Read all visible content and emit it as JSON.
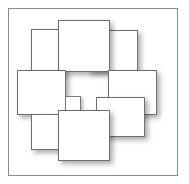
{
  "figure": {
    "title": "",
    "canvas": {
      "width": 189,
      "height": 184,
      "background": "#ffffff"
    },
    "frame": {
      "name": "outer-frame",
      "x": 8,
      "y": 8,
      "width": 170,
      "height": 168,
      "stroke": "#8c8c8c",
      "fill": "#ffffff"
    },
    "shadow": {
      "offset_x": 3,
      "offset_y": 3,
      "blur": 5,
      "color": "rgba(0,0,0,0.32)"
    },
    "tiles": [
      {
        "id": "tile-top-left",
        "label": "",
        "x": 31,
        "y": 29,
        "width": 32,
        "height": 46,
        "z": 2,
        "stroke": "#6e6e6e",
        "fill": "#ffffff"
      },
      {
        "id": "tile-top-center",
        "label": "",
        "x": 58,
        "y": 20,
        "width": 52,
        "height": 52,
        "z": 4,
        "stroke": "#6e6e6e",
        "fill": "#ffffff"
      },
      {
        "id": "tile-top-right",
        "label": "",
        "x": 88,
        "y": 30,
        "width": 50,
        "height": 42,
        "z": 3,
        "stroke": "#6e6e6e",
        "fill": "#ffffff"
      },
      {
        "id": "tile-middle-left",
        "label": "",
        "x": 17,
        "y": 70,
        "width": 49,
        "height": 45,
        "z": 5,
        "stroke": "#6e6e6e",
        "fill": "#ffffff"
      },
      {
        "id": "tile-center",
        "label": "",
        "x": 65,
        "y": 96,
        "width": 16,
        "height": 17,
        "z": 6,
        "stroke": "#7a7a7a",
        "fill": "#ffffff"
      },
      {
        "id": "tile-middle-right",
        "label": "",
        "x": 108,
        "y": 70,
        "width": 49,
        "height": 45,
        "z": 5,
        "stroke": "#6e6e6e",
        "fill": "#ffffff"
      },
      {
        "id": "tile-bottom-left",
        "label": "",
        "x": 31,
        "y": 114,
        "width": 49,
        "height": 36,
        "z": 7,
        "stroke": "#6e6e6e",
        "fill": "#ffffff"
      },
      {
        "id": "tile-bottom-right",
        "label": "",
        "x": 96,
        "y": 97,
        "width": 49,
        "height": 40,
        "z": 8,
        "stroke": "#6e6e6e",
        "fill": "#ffffff"
      },
      {
        "id": "tile-bottom-center",
        "label": "",
        "x": 58,
        "y": 110,
        "width": 52,
        "height": 51,
        "z": 9,
        "stroke": "#6e6e6e",
        "fill": "#ffffff"
      }
    ]
  }
}
